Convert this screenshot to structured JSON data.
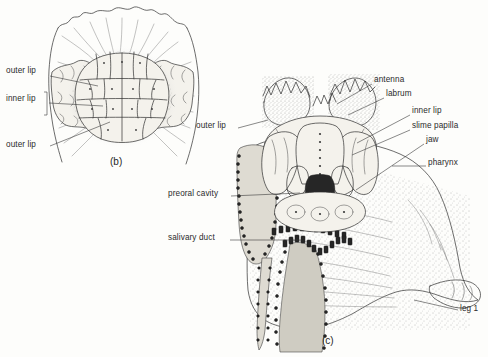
{
  "figure": {
    "background_color": "#fdfdfb",
    "ink_color": "#2e2e2e",
    "width": 488,
    "height": 357
  },
  "panels": [
    {
      "id": "b",
      "caption": "(b)",
      "caption_x": 110,
      "caption_y": 163,
      "description": "Ventral view of mouth surrounded by outer and inner lips"
    },
    {
      "id": "c",
      "caption": "(c)",
      "caption_x": 322,
      "caption_y": 342,
      "description": "Mouth opened to show labrum, jaws, pharynx and preoral cavity"
    }
  ],
  "labels_panel_b": [
    {
      "text": "outer lip",
      "x": 6,
      "y": 73,
      "align": "left",
      "leader": [
        [
          50,
          76
        ],
        [
          98,
          86
        ]
      ]
    },
    {
      "text": "inner lip",
      "x": 6,
      "y": 101,
      "align": "left",
      "leader": [
        [
          49,
          103
        ],
        [
          103,
          106
        ]
      ],
      "bracket": {
        "x": 44,
        "y_top": 92,
        "y_bottom": 115
      }
    },
    {
      "text": "outer lip",
      "x": 6,
      "y": 147,
      "align": "left",
      "leader": [
        [
          50,
          146
        ],
        [
          110,
          122
        ]
      ]
    }
  ],
  "labels_panel_c": [
    {
      "text": "outer lip",
      "x": 196,
      "y": 128,
      "align": "left",
      "leader": [
        [
          238,
          128
        ],
        [
          268,
          120
        ]
      ]
    },
    {
      "text": "preoral cavity",
      "x": 168,
      "y": 196,
      "align": "left",
      "leader": [
        [
          231,
          196
        ],
        [
          300,
          193
        ]
      ]
    },
    {
      "text": "salivary duct",
      "x": 168,
      "y": 240,
      "align": "left",
      "leader": [
        [
          230,
          240
        ],
        [
          302,
          240
        ]
      ]
    },
    {
      "text": "antenna",
      "x": 374,
      "y": 82,
      "align": "left",
      "leader": [
        [
          372,
          84
        ],
        [
          337,
          104
        ]
      ]
    },
    {
      "text": "labrum",
      "x": 386,
      "y": 96,
      "align": "left",
      "leader": [
        [
          384,
          98
        ],
        [
          348,
          115
        ]
      ]
    },
    {
      "text": "inner lip",
      "x": 412,
      "y": 113,
      "align": "left",
      "leader": [
        [
          410,
          115
        ],
        [
          357,
          143
        ]
      ]
    },
    {
      "text": "slime papilla",
      "x": 412,
      "y": 128,
      "align": "left",
      "leader": [
        [
          410,
          130
        ],
        [
          352,
          155
        ]
      ]
    },
    {
      "text": "jaw",
      "x": 426,
      "y": 142,
      "align": "left",
      "leader": [
        [
          424,
          144
        ],
        [
          356,
          190
        ]
      ]
    },
    {
      "text": "pharynx",
      "x": 428,
      "y": 165,
      "align": "left",
      "leader": [
        [
          426,
          166
        ],
        [
          392,
          166
        ]
      ]
    },
    {
      "text": "leg 1",
      "x": 460,
      "y": 311,
      "align": "left",
      "leader": [
        [
          458,
          310
        ],
        [
          414,
          300
        ]
      ]
    }
  ],
  "anatomy_terms": [
    "outer lip",
    "inner lip",
    "antenna",
    "labrum",
    "slime papilla",
    "jaw",
    "pharynx",
    "preoral cavity",
    "salivary duct",
    "leg 1"
  ]
}
